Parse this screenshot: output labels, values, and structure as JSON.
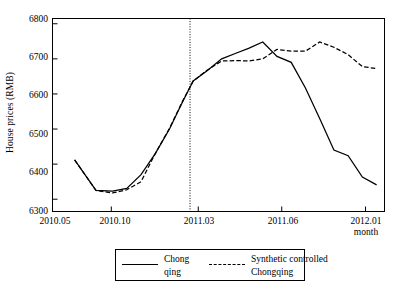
{
  "chart_data": {
    "type": "line",
    "title": "",
    "xlabel": "month",
    "ylabel": "House prices (RMB)",
    "ylim": [
      6265,
      6815
    ],
    "xlim": [
      0,
      21
    ],
    "grid": false,
    "legend_position": "below-plot-center",
    "y_ticks": [
      6300,
      6400,
      6500,
      6600,
      6700,
      6800
    ],
    "x_ticks": [
      {
        "label": "2010.05",
        "x": 0
      },
      {
        "label": "2010.10",
        "x": 3.72
      },
      {
        "label": "2011.03",
        "x": 9.22
      },
      {
        "label": "2011.06",
        "x": 14.5
      },
      {
        "label": "2012.01",
        "x": 19.8
      }
    ],
    "annotations": [
      {
        "type": "vline",
        "label": "treatment-start",
        "x": 8.7,
        "style": "dotted"
      }
    ],
    "x": [
      1.4,
      2.75,
      3.8,
      4.7,
      5.6,
      6.5,
      7.4,
      8.2,
      8.9,
      9.8,
      10.7,
      11.6,
      12.4,
      13.3,
      14.2,
      15.1,
      16.0,
      16.9,
      17.8,
      18.7,
      19.6,
      20.5
    ],
    "series": [
      {
        "name": "Chongqing",
        "style": "solid",
        "values": [
          6412,
          6325,
          6323,
          6331,
          6370,
          6430,
          6500,
          6575,
          6637,
          6667,
          6700,
          6716,
          6730,
          6748,
          6707,
          6690,
          6617,
          6530,
          6440,
          6424,
          6363,
          6341
        ]
      },
      {
        "name": "Synthetic controlled Chongqing",
        "style": "dashed",
        "values": [
          6412,
          6325,
          6318,
          6327,
          6350,
          6430,
          6502,
          6577,
          6637,
          6668,
          6694,
          6695,
          6694,
          6700,
          6727,
          6722,
          6722,
          6748,
          6733,
          6712,
          6678,
          6672
        ]
      }
    ]
  },
  "axis": {
    "y_label": "House prices (RMB)",
    "x_label": "month",
    "y_tick_labels": [
      "6800",
      "6700",
      "6600",
      "6500",
      "6400",
      "6300"
    ],
    "x_tick_labels": [
      "2010.05",
      "2010.10",
      "2011.03",
      "2011.06",
      "2012.01"
    ]
  },
  "legend": {
    "items": [
      {
        "label_line1": "Chong",
        "label_line2": "qing",
        "style": "solid"
      },
      {
        "label_line1": "Synthetic controlled",
        "label_line2": "Chongqing",
        "style": "dashed"
      }
    ]
  }
}
